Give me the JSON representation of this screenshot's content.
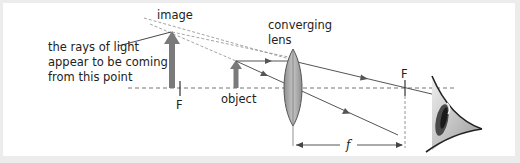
{
  "diagram": {
    "labels": {
      "image": "image",
      "object": "object",
      "lens_line1": "converging",
      "lens_line2": "lens",
      "annotation_line1": "the rays of light",
      "annotation_line2": "appear to be coming",
      "annotation_line3": "from this point",
      "focal_left": "F",
      "focal_right": "F",
      "focal_length": "f"
    },
    "colors": {
      "background": "#ffffff",
      "frame": "#ececec",
      "arrow": "#7a7a7a",
      "ray": "#555555",
      "dashed": "#888888",
      "lens_fill": "#a9a9a9",
      "lens_stroke": "#555555"
    }
  }
}
